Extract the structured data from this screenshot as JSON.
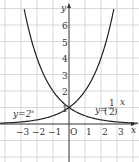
{
  "chart_data": {
    "type": "line",
    "title": "",
    "xlabel": "x",
    "ylabel": "y",
    "origin_label": "O",
    "xlim": [
      -4,
      4
    ],
    "ylim": [
      -2,
      7
    ],
    "grid": true,
    "x_ticks": [
      "−3",
      "−2",
      "−1",
      "1",
      "2",
      "3"
    ],
    "y_ticks": [
      "1",
      "2",
      "3",
      "4",
      "5",
      "6"
    ],
    "series": [
      {
        "name": "y=2^x",
        "label": "y=2",
        "exponent": "x",
        "x": [
          -4,
          -3,
          -2,
          -1,
          0,
          1,
          2,
          2.8
        ],
        "y": [
          0.0625,
          0.125,
          0.25,
          0.5,
          1,
          2,
          4,
          6.96
        ]
      },
      {
        "name": "y=(1/2)^x",
        "label_prefix": "y=",
        "label_num": "1",
        "label_den": "2",
        "exponent": "x",
        "x": [
          -2.8,
          -2,
          -1,
          0,
          1,
          2,
          3,
          4
        ],
        "y": [
          6.96,
          4,
          2,
          1,
          0.5,
          0.25,
          0.125,
          0.0625
        ]
      }
    ],
    "intersection": {
      "x": 0,
      "y": 1
    }
  }
}
